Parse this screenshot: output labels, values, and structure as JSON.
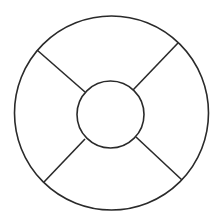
{
  "diagram": {
    "type": "concentric-circles-with-spokes",
    "background": "#ffffff",
    "stroke_color": "#2a2a2a",
    "outer_circle": {
      "cx": 111.5,
      "cy": 113,
      "r": 97
    },
    "inner_circle": {
      "cx": 110.5,
      "cy": 114.5,
      "r": 33.5
    },
    "spokes": [
      {
        "name": "upper-left",
        "x1": 37,
        "y1": 50,
        "x2": 85,
        "y2": 92
      },
      {
        "name": "upper-right",
        "x1": 178,
        "y1": 43,
        "x2": 133,
        "y2": 90
      },
      {
        "name": "lower-left",
        "x1": 44,
        "y1": 182,
        "x2": 85,
        "y2": 139
      },
      {
        "name": "lower-right",
        "x1": 182,
        "y1": 180,
        "x2": 136,
        "y2": 137
      }
    ]
  }
}
